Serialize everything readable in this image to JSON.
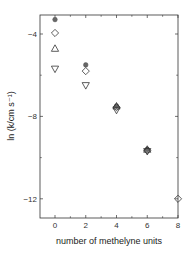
{
  "chart_data": {
    "type": "scatter",
    "title": "",
    "xlabel": "number of methelyne units",
    "ylabel": "ln (k/cm s⁻¹)",
    "xlim": [
      -1,
      8
    ],
    "ylim": [
      -13,
      -3.05
    ],
    "xticks": [
      0,
      2,
      4,
      6,
      8
    ],
    "yticks": [
      -4,
      -8,
      -12
    ],
    "grid": false,
    "legend": null,
    "series": [
      {
        "name": "filled circle",
        "marker": "circle-filled",
        "x": [
          0,
          2,
          4,
          6
        ],
        "y": [
          -3.3,
          -5.5,
          -7.5,
          -9.6
        ]
      },
      {
        "name": "open diamond",
        "marker": "diamond",
        "x": [
          0,
          2,
          4,
          6,
          8
        ],
        "y": [
          -3.95,
          -5.8,
          -7.55,
          -9.65,
          -12.0
        ]
      },
      {
        "name": "open triangle up",
        "marker": "triangle-up",
        "x": [
          0,
          4,
          6
        ],
        "y": [
          -4.7,
          -7.5,
          -9.6
        ]
      },
      {
        "name": "open triangle down",
        "marker": "triangle-down",
        "x": [
          0,
          2,
          4,
          6
        ],
        "y": [
          -5.7,
          -6.5,
          -7.7,
          -9.7
        ]
      }
    ]
  },
  "axes": {
    "x_tick_labels": [
      "0",
      "2",
      "4",
      "6",
      "8"
    ],
    "y_tick_labels": [
      "-4",
      "-8",
      "-12"
    ],
    "xlabel": "number of methelyne units",
    "ylabel": "ln (k/cm s⁻¹)"
  }
}
